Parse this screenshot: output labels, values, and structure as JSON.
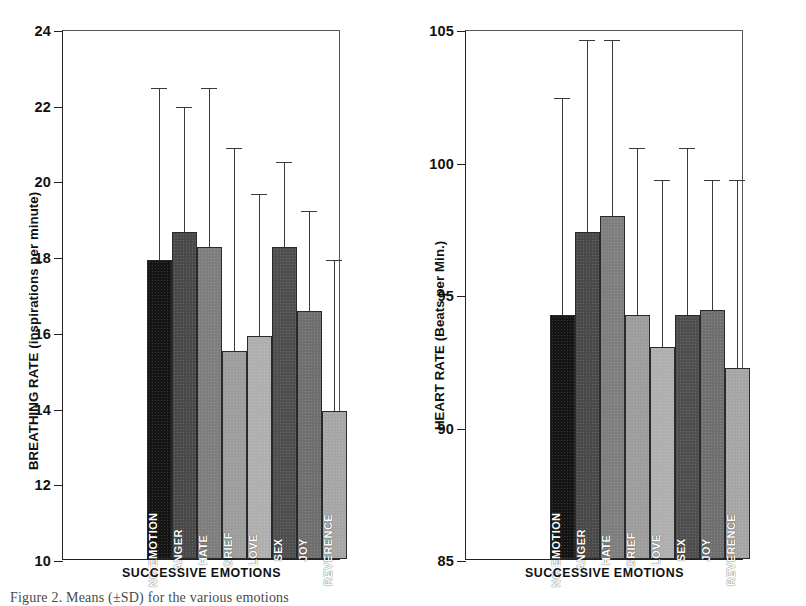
{
  "figure": {
    "caption": "Figure 2. Means (±SD) for the various emotions"
  },
  "panels": [
    {
      "id": "breathing",
      "ytitle": "BREATHING RATE (inspirations per minute)",
      "xtitle": "SUCCESSIVE EMOTIONS",
      "yticks": [
        "24",
        "22",
        "20",
        "18",
        "16",
        "14",
        "12",
        "10"
      ]
    },
    {
      "id": "heart",
      "ytitle": "HEART RATE (Beats per Min.)",
      "xtitle": "SUCCESSIVE EMOTIONS",
      "yticks": [
        "105",
        "100",
        "95",
        "90",
        "85"
      ]
    }
  ],
  "chart_data": [
    {
      "type": "bar",
      "title": "",
      "xlabel": "SUCCESSIVE EMOTIONS",
      "ylabel": "BREATHING RATE (inspirations per minute)",
      "ylim": [
        10,
        24
      ],
      "ytick_values": [
        24,
        22,
        20,
        18,
        16,
        14,
        12,
        10
      ],
      "grid": false,
      "legend": "none",
      "categories": [
        "NO EMOTION",
        "ANGER",
        "HATE",
        "GRIEF",
        "LOVE",
        "SEX",
        "JOY",
        "REVERENCE"
      ],
      "values": [
        17.9,
        18.65,
        18.25,
        15.5,
        15.9,
        18.25,
        16.55,
        13.9
      ],
      "error_upper": [
        22.45,
        21.95,
        22.45,
        20.85,
        19.65,
        20.5,
        19.2,
        17.9
      ],
      "colors": [
        "#141414",
        "#4a4a4a",
        "#7e7e7e",
        "#9d9d9d",
        "#afafaf",
        "#4f4f4f",
        "#6f6f6f",
        "#a6a6a6"
      ]
    },
    {
      "type": "bar",
      "title": "",
      "xlabel": "SUCCESSIVE EMOTIONS",
      "ylabel": "HEART RATE (Beats per Min.)",
      "ylim": [
        85,
        105
      ],
      "ytick_values": [
        105,
        100,
        95,
        90,
        85
      ],
      "grid": false,
      "legend": "none",
      "categories": [
        "NO EMOTION",
        "ANGER",
        "HATE",
        "GRIEF",
        "LOVE",
        "SEX",
        "JOY",
        "REVERENCE"
      ],
      "values": [
        94.2,
        97.35,
        97.95,
        94.2,
        93.0,
        94.2,
        94.4,
        92.2
      ],
      "error_upper": [
        102.4,
        104.6,
        104.6,
        100.5,
        99.3,
        100.5,
        99.3,
        99.3
      ],
      "colors": [
        "#141414",
        "#4a4a4a",
        "#7e7e7e",
        "#9d9d9d",
        "#afafaf",
        "#4f4f4f",
        "#6f6f6f",
        "#a6a6a6"
      ]
    }
  ]
}
